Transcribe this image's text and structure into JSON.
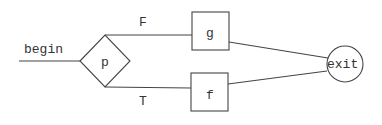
{
  "diagram": {
    "type": "flowchart",
    "nodes": {
      "begin": {
        "label": "begin"
      },
      "decision": {
        "label": "p",
        "shape": "diamond"
      },
      "g": {
        "label": "g",
        "shape": "box"
      },
      "f": {
        "label": "f",
        "shape": "box"
      },
      "exit": {
        "label": "exit",
        "shape": "circle"
      }
    },
    "edges": {
      "false": {
        "label": "F",
        "from": "p",
        "to": "g"
      },
      "true": {
        "label": "T",
        "from": "p",
        "to": "f"
      }
    },
    "colors": {
      "line": "#444444",
      "text": "#333333",
      "background": "#ffffff"
    }
  }
}
